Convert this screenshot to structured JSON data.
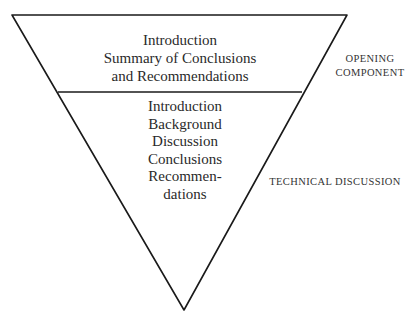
{
  "diagram": {
    "type": "inverted-pyramid",
    "colors": {
      "line": "#1a1a1a",
      "text": "#2a2a2a",
      "background": "#ffffff"
    },
    "sections": [
      {
        "id": "opening",
        "label": "OPENING COMPONENT",
        "label_lines": [
          "OPENING",
          "COMPONENT"
        ],
        "lines": [
          "Introduction",
          "Summary of Conclusions",
          "and Recommendations"
        ]
      },
      {
        "id": "technical",
        "label": "TECHNICAL DISCUSSION",
        "label_lines": [
          "TECHNICAL DISCUSSION"
        ],
        "lines": [
          "Introduction",
          "Background",
          "Discussion",
          "Conclusions",
          "Recommen-",
          "dations"
        ]
      }
    ]
  }
}
